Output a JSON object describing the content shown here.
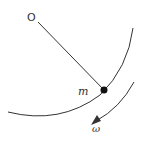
{
  "diagram": {
    "type": "rotating pendulum / point mass on circular path",
    "labels": {
      "pivot": "O",
      "mass": "m",
      "angular_velocity": "ω"
    },
    "elements": [
      {
        "name": "pivot-point",
        "label": "O"
      },
      {
        "name": "rod",
        "from": "O",
        "to": "m"
      },
      {
        "name": "mass",
        "label": "m"
      },
      {
        "name": "circular-path",
        "description": "arc of circle centered at O"
      },
      {
        "name": "rotation-arrow",
        "label": "ω",
        "direction": "clockwise"
      }
    ],
    "colors": {
      "stroke": "#333333",
      "mass": "#111111",
      "background": "#ffffff"
    }
  }
}
